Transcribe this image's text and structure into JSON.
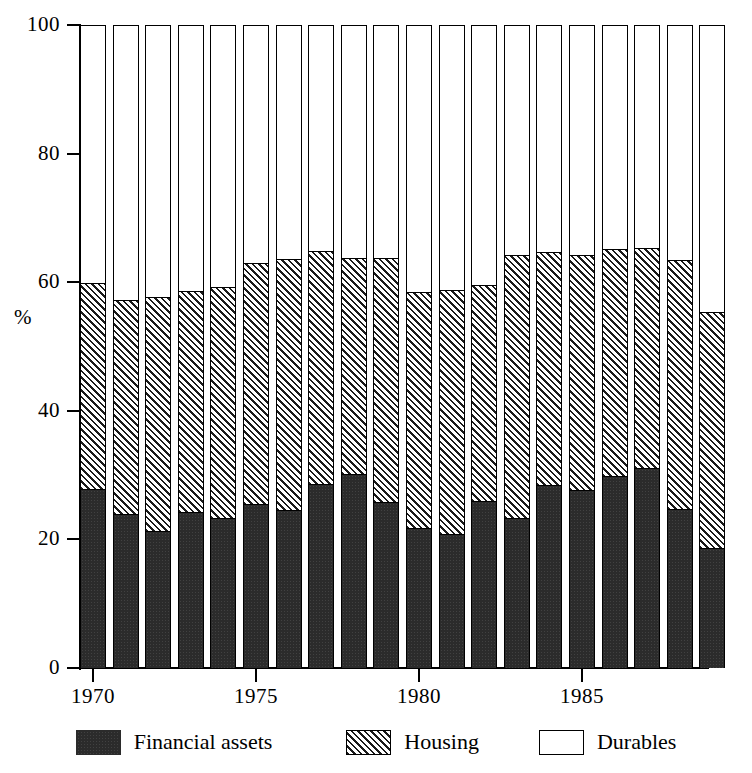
{
  "chart_data": {
    "type": "bar",
    "stacked": true,
    "title": "",
    "subtitle": "",
    "xlabel": "",
    "ylabel": "%",
    "ylim": [
      0,
      100
    ],
    "yticks": [
      0,
      20,
      40,
      60,
      80,
      100
    ],
    "ytick_labels": [
      "0",
      "20",
      "40",
      "60",
      "80",
      "100"
    ],
    "grid": false,
    "legend_position": "bottom",
    "xticks": [
      1970,
      1975,
      1980,
      1985
    ],
    "xtick_labels": [
      "1970",
      "1975",
      "1980",
      "1985"
    ],
    "categories": [
      "1970",
      "1971",
      "1972",
      "1973",
      "1974",
      "1975",
      "1976",
      "1977",
      "1978",
      "1979",
      "1980",
      "1981",
      "1982",
      "1983",
      "1984",
      "1985",
      "1986",
      "1987",
      "1988",
      "1989"
    ],
    "series": [
      {
        "name": "Financial assets",
        "color": "#2b2b2b",
        "pattern": "solid",
        "values": [
          27.8,
          23.9,
          21.3,
          24.3,
          23.4,
          25.5,
          24.5,
          28.6,
          30.1,
          25.8,
          21.7,
          20.8,
          26.0,
          23.4,
          28.5,
          27.7,
          29.9,
          31.1,
          24.8,
          18.7
        ]
      },
      {
        "name": "Housing",
        "color": "#808080",
        "pattern": "diagonal-hatch",
        "values": [
          32.1,
          33.3,
          36.4,
          34.4,
          35.8,
          37.5,
          39.1,
          36.2,
          33.7,
          37.9,
          36.7,
          38.0,
          33.6,
          40.8,
          36.2,
          36.6,
          35.2,
          34.2,
          38.6,
          36.7
        ]
      },
      {
        "name": "Durables",
        "color": "#ffffff",
        "pattern": "empty",
        "values": [
          40.1,
          42.8,
          42.3,
          41.3,
          40.8,
          37.0,
          36.4,
          35.2,
          36.2,
          36.3,
          41.6,
          41.2,
          40.4,
          35.8,
          35.3,
          35.7,
          34.9,
          34.7,
          36.6,
          44.6
        ]
      }
    ]
  },
  "axes": {
    "y_axis_title": "%"
  },
  "legend": {
    "items": [
      {
        "label": "Financial assets",
        "swatch": "solid-dark-swatch"
      },
      {
        "label": "Housing",
        "swatch": "hatched-swatch"
      },
      {
        "label": "Durables",
        "swatch": "empty-swatch"
      }
    ]
  }
}
